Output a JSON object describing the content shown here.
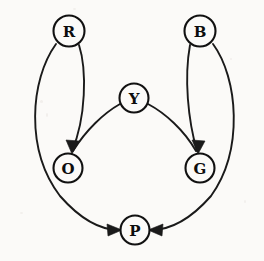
{
  "diagram": {
    "type": "directed-graph",
    "background_color": "#fbfaf8",
    "stroke_color": "#1a1a1a",
    "node_fill_color": "#fbfaf8",
    "node_label_color": "#0d0d0d",
    "nodes": [
      {
        "id": "R",
        "label": "R",
        "cx": 69,
        "cy": 31,
        "r": 15.5
      },
      {
        "id": "B",
        "label": "B",
        "cx": 200,
        "cy": 31,
        "r": 15.5
      },
      {
        "id": "Y",
        "label": "Y",
        "cx": 134,
        "cy": 98,
        "r": 14.5
      },
      {
        "id": "O",
        "label": "O",
        "cx": 68,
        "cy": 168,
        "r": 14.5
      },
      {
        "id": "G",
        "label": "G",
        "cx": 200,
        "cy": 168,
        "r": 14.5
      },
      {
        "id": "P",
        "label": "P",
        "cx": 135,
        "cy": 230,
        "r": 14.5
      }
    ],
    "edges": [
      {
        "id": "R-O",
        "from": "R",
        "to": "O",
        "directed": true,
        "label": ""
      },
      {
        "id": "R-P",
        "from": "R",
        "to": "P",
        "directed": true,
        "label": ""
      },
      {
        "id": "B-G",
        "from": "B",
        "to": "G",
        "directed": true,
        "label": ""
      },
      {
        "id": "B-P",
        "from": "B",
        "to": "P",
        "directed": true,
        "label": ""
      },
      {
        "id": "Y-O",
        "from": "Y",
        "to": "O",
        "directed": true,
        "label": ""
      },
      {
        "id": "Y-G",
        "from": "Y",
        "to": "G",
        "directed": true,
        "label": ""
      }
    ],
    "edge_paths": {
      "R-O": "M 79,45 C 87,70 86,118 72,151",
      "R-P": "M 56,44 C 30,80 25,150 60,196 C 82,221 102,230 119,230",
      "B-G": "M 190,45 C 184,78 188,120 197,151",
      "B-P": "M 213,44 C 238,78 244,150 211,196 C 189,221 168,230 151,230",
      "Y-O": "M 120,104 C 104,113 86,130 73,151",
      "Y-G": "M 148,104 C 165,113 184,130 196,151"
    },
    "arrow_heads": [
      {
        "id": "arrow-R-O",
        "points": "72,154 66,140 79,141",
        "rotation": 0
      },
      {
        "id": "arrow-Y-O",
        "points": "72,154 66,140 79,141",
        "rotation": 0
      },
      {
        "id": "arrow-B-G",
        "points": "198,154 192,140 205,141",
        "rotation": 0
      },
      {
        "id": "arrow-Y-G",
        "points": "198,154 192,140 205,141",
        "rotation": 0
      },
      {
        "id": "arrow-R-P",
        "points": "122,230 107,224 108,236",
        "rotation": 0
      },
      {
        "id": "arrow-B-P",
        "points": "148,230 163,224 162,236",
        "rotation": 0
      }
    ]
  }
}
